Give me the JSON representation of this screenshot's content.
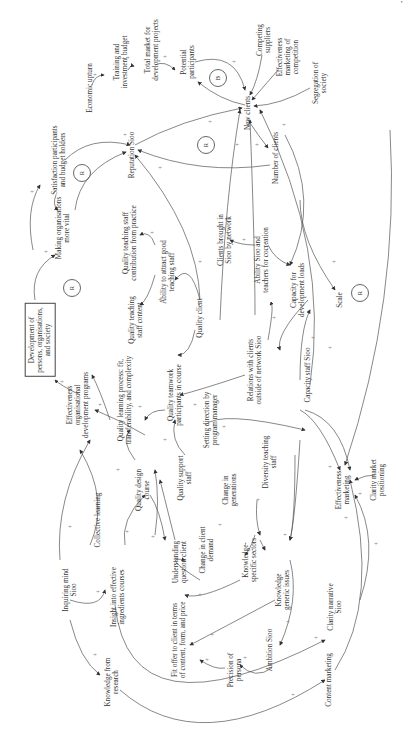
{
  "diagram": {
    "type": "causal-loop-diagram",
    "orientation": "rotated-90-ccw",
    "page_mark": "’",
    "nodes": [
      {
        "id": "economic_upturn",
        "label": "Economic upturn"
      },
      {
        "id": "training_budget",
        "label": "Training and\ninvestment budget"
      },
      {
        "id": "total_market",
        "label": "Total market for\ndevelopment projects"
      },
      {
        "id": "potential_participants",
        "label": "Potential\nparticipants"
      },
      {
        "id": "competing_suppliers",
        "label": "Competing\nsuppliers"
      },
      {
        "id": "effectiveness_marketing_competition",
        "label": "Effectiveness\nmarketing of\ncompetition"
      },
      {
        "id": "segregation_society",
        "label": "Segregation of\nsociety"
      },
      {
        "id": "new_clients",
        "label": "New clients"
      },
      {
        "id": "number_of_clients",
        "label": "Number of clients"
      },
      {
        "id": "reputation_sioo",
        "label": "Reputation Sioo"
      },
      {
        "id": "satisfaction",
        "label": "Satisfaction participants\nand budget holders"
      },
      {
        "id": "making_organisations_vital",
        "label": "Making organisations\nmore vital"
      },
      {
        "id": "development_persons",
        "label": "Development of\npersons, organisations,\nand society",
        "boxed": true
      },
      {
        "id": "quality_teaching_practice",
        "label": "Quality teaching staff\ncontribution from practice"
      },
      {
        "id": "ability_attract_staff",
        "label": "Ability to attract good\nteaching staff"
      },
      {
        "id": "quality_teaching_content",
        "label": "Quality teaching\nstaff content"
      },
      {
        "id": "quality_client",
        "label": "Quality client"
      },
      {
        "id": "clients_by_network",
        "label": "Clients brought in\nSioo by network"
      },
      {
        "id": "ability_cocreation",
        "label": "Ability Sioo and\nteachers for cocreation"
      },
      {
        "id": "capacity_dev_loads",
        "label": "Capacity for\ndevelopment loads"
      },
      {
        "id": "scale",
        "label": "Scale"
      },
      {
        "id": "relations_clients",
        "label": "Relations with clients\noutside of network Sioo"
      },
      {
        "id": "capacity_staff",
        "label": "Capacity staff Sioo"
      },
      {
        "id": "effectiveness_org_programs",
        "label": "Effectiveness\norganisational\ndevelopment programs"
      },
      {
        "id": "quality_learning_process",
        "label": "Quality learning process: fit,\ntransferability, and complexity"
      },
      {
        "id": "quality_teamwork",
        "label": "Quality teamwork\nparticipants in course"
      },
      {
        "id": "setting_direction",
        "label": "Setting direction by\nprogram manager"
      },
      {
        "id": "quality_support_staff",
        "label": "Quality support\nstaff"
      },
      {
        "id": "quality_design_course",
        "label": "Quality design\ncourse"
      },
      {
        "id": "change_generations",
        "label": "Change in\ngenerations"
      },
      {
        "id": "diversity_teaching",
        "label": "Diversity teaching\nstaff"
      },
      {
        "id": "effectiveness_marketing",
        "label": "Effectiveness\nmarketing"
      },
      {
        "id": "clarity_market",
        "label": "Clarity market\npositioning"
      },
      {
        "id": "collective_learning",
        "label": "Collective learning"
      },
      {
        "id": "understanding_client",
        "label": "Understanding\nquestion client"
      },
      {
        "id": "change_client_demand",
        "label": "Change in client\ndemand"
      },
      {
        "id": "knowledge_specific",
        "label": "Knowledge-\nspecific sectors"
      },
      {
        "id": "inquiring_mind",
        "label": "Inquiring mind\nSioo"
      },
      {
        "id": "insight_courses",
        "label": "Insight into effective\ningredients courses"
      },
      {
        "id": "knowledge_generic",
        "label": "Knowledge\ngeneric issues"
      },
      {
        "id": "fit_offer",
        "label": "Fit offer to client in terms\nof content, form, and price"
      },
      {
        "id": "ambition_sioo",
        "label": "Ambition Sioo"
      },
      {
        "id": "precision_persona",
        "label": "Precision of\npersona"
      },
      {
        "id": "clarity_narrative",
        "label": "Clarity narrative\nSioo"
      },
      {
        "id": "knowledge_research",
        "label": "Knowledge from\nresearch"
      },
      {
        "id": "content_marketing",
        "label": "Content marketing"
      }
    ],
    "loop_markers": [
      {
        "id": "loop_b",
        "label": "B"
      },
      {
        "id": "loop_r1",
        "label": "R"
      },
      {
        "id": "loop_r2",
        "label": "R"
      },
      {
        "id": "loop_r3",
        "label": "R"
      },
      {
        "id": "loop_r4",
        "label": "R"
      }
    ],
    "polarity_symbol": "+"
  }
}
